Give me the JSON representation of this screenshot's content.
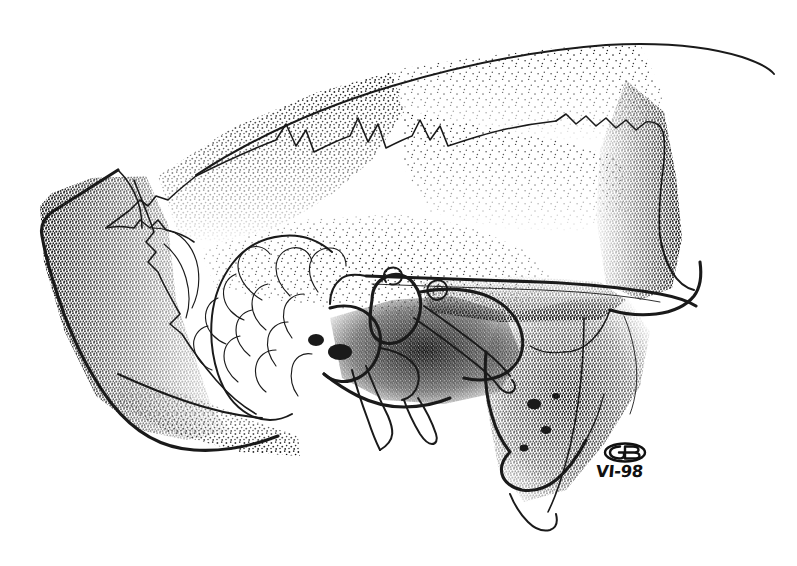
{
  "figure": {
    "kind": "scientific-illustration",
    "medium": "pen-and-ink stipple drawing",
    "orientation": "rostrum to the right, occiput to the left",
    "background_color": "#ffffff",
    "ink_color": "#1a1a1a",
    "width_px": 797,
    "height_px": 566
  },
  "signature": {
    "monogram_label": "GB",
    "monogram_shape": "oval cartouche enclosing joined G and B letters",
    "date": "VI-98",
    "date_meaning": "June 1998"
  },
  "anatomy_regions": [
    {
      "id": "cranial-vault",
      "label": "cranial vault / dorsal roof"
    },
    {
      "id": "sagittal-suture",
      "label": "zigzag dorsal suture line"
    },
    {
      "id": "occipital-region",
      "label": "occipital region (left, heavily stippled)"
    },
    {
      "id": "temporal-region",
      "label": "temporal fossa"
    },
    {
      "id": "zygomatic-arch",
      "label": "zygomatic arch"
    },
    {
      "id": "basicranium",
      "label": "basicranial / tympanic region"
    },
    {
      "id": "turbinate-scrolls",
      "label": "scroll-like turbinate structures"
    },
    {
      "id": "pterygoid-process",
      "label": "pterygoid process"
    },
    {
      "id": "styliform-process",
      "label": "slender styliform process"
    },
    {
      "id": "posterior-hook",
      "label": "curved hook-shaped process (right edge)"
    }
  ],
  "stipple": {
    "description": "dense dot shading, heaviest along bone margins and within the temporal and basicranial regions",
    "dot_color": "#111111"
  }
}
